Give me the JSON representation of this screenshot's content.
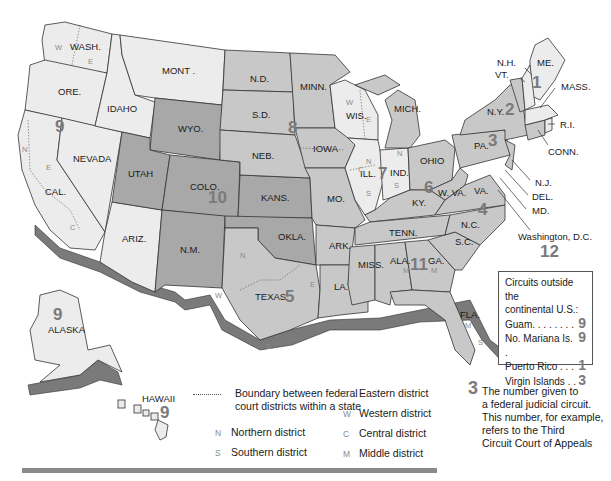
{
  "map": {
    "states": {
      "wash": "WASH.",
      "ore": "ORE.",
      "cal": "CAL.",
      "nevada": "NEVADA",
      "idaho": "IDAHO",
      "mont": "MONT .",
      "wyo": "WYO.",
      "utah": "UTAH",
      "colo": "COLO.",
      "ariz": "ARIZ.",
      "nm": "N.M.",
      "nd": "N.D.",
      "sd": "S.D.",
      "neb": "NEB.",
      "kans": "KANS.",
      "okla": "OKLA.",
      "texas": "TEXAS",
      "minn": "MINN.",
      "iowa": "IOWA",
      "mo": "MO.",
      "ark": "ARK.",
      "la": "LA.",
      "wis": "WIS.",
      "ill": "ILL.",
      "mich": "MICH.",
      "ind": "IND.",
      "ohio": "OHIO",
      "ky": "KY.",
      "tenn": "TENN.",
      "miss": "MISS.",
      "ala": "ALA.",
      "ga": "GA.",
      "fla": "FLA.",
      "sc": "S.C.",
      "nc": "N.C.",
      "va": "VA.",
      "wva": "W. VA.",
      "pa": "PA.",
      "ny": "N.Y.",
      "vt": "VT.",
      "nh": "N.H.",
      "me": "ME.",
      "mass": "MASS.",
      "ri": "R.I.",
      "conn": "CONN.",
      "nj": "N.J.",
      "del": "DEL.",
      "md": "MD.",
      "dc": "Washington, D.C.",
      "alaska": "ALASKA",
      "hawaii": "HAWAII"
    },
    "circuits": {
      "c1": "1",
      "c2": "2",
      "c3": "3",
      "c4": "4",
      "c5": "5",
      "c6": "6",
      "c7": "7",
      "c8": "8",
      "c9": "9",
      "c10": "10",
      "c11": "11",
      "c12": "12",
      "c9_alaska": "9",
      "c9_hawaii": "9"
    },
    "district_letters": {
      "N": "N",
      "S": "S",
      "E": "E",
      "W": "W",
      "C": "C",
      "M": "M"
    }
  },
  "outside_continental": {
    "title_line1": "Circuits outside the",
    "title_line2": "continental U.S.:",
    "items": [
      {
        "label": "Guam. . . . . . . .",
        "circuit": "9"
      },
      {
        "label": "No. Mariana Is. .",
        "circuit": "9"
      },
      {
        "label": "Puerto Rico . . .",
        "circuit": "1"
      },
      {
        "label": "Virgin Islands . .",
        "circuit": "3"
      }
    ]
  },
  "legend": {
    "boundary_line1": "Boundary between federal",
    "boundary_line2": "court districts within a state",
    "districts": [
      {
        "key": "N",
        "label": "Northern district"
      },
      {
        "key": "S",
        "label": "Southern district"
      },
      {
        "key": "E",
        "label": "Eastern district"
      },
      {
        "key": "W",
        "label": "Western district"
      },
      {
        "key": "C",
        "label": "Central district"
      },
      {
        "key": "M",
        "label": "Middle district"
      }
    ],
    "circuit_example_num": "3",
    "circuit_note": [
      "The number given to",
      "a federal judicial circuit.",
      "This number, for example,",
      "refers to the Third",
      "Circuit Court of Appeals"
    ]
  }
}
